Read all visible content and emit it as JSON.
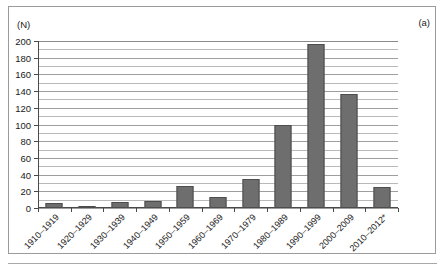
{
  "figure": {
    "panel_label": "(a)",
    "unit_label": "(N)"
  },
  "chart_data": {
    "type": "bar",
    "title": "",
    "subtitle": "",
    "xlabel": "",
    "ylabel": "(N)",
    "panel": "(a)",
    "categories": [
      "1910–1919",
      "1920–1929",
      "1930–1939",
      "1940–1949",
      "1950–1959",
      "1960–1969",
      "1970–1979",
      "1980–1989",
      "1990–1999",
      "2000–2009",
      "2010–2012*"
    ],
    "values": [
      6,
      2,
      7,
      9,
      26,
      13,
      35,
      100,
      196,
      137,
      25
    ],
    "ylim": [
      0,
      200
    ],
    "ytick_labels": [
      "0",
      "20",
      "40",
      "60",
      "80",
      "100",
      "120",
      "140",
      "160",
      "180",
      "200"
    ],
    "ytick_values": [
      0,
      20,
      40,
      60,
      80,
      100,
      120,
      140,
      160,
      180,
      200
    ],
    "minor_tick_step": 10,
    "grid": true,
    "grid_axis": "y",
    "legend": null,
    "legend_position": "none",
    "bar_color": "#6e6e6e",
    "bar_edge_color": "#4d4d4d",
    "background_color": "#ffffff",
    "axis_color": "#4a4a4a",
    "gridline_color": "#b9b9b9",
    "footnote": "*"
  }
}
